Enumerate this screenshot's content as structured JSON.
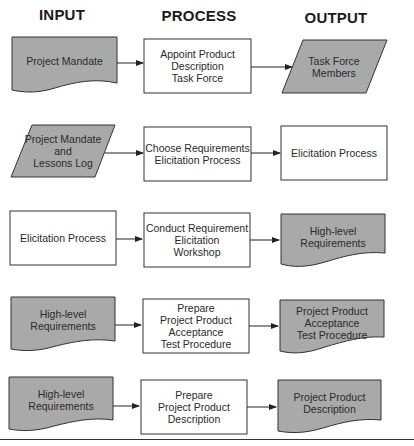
{
  "headers": {
    "input": "INPUT",
    "process": "PROCESS",
    "output": "OUTPUT"
  },
  "colors": {
    "shaded_fill": "#a9a9a9",
    "plain_fill": "#ffffff",
    "stroke": "#333333"
  },
  "rows": [
    {
      "input": {
        "shape": "document",
        "shaded": true,
        "label": "Project Mandate"
      },
      "process": {
        "shape": "rectangle",
        "label": "Appoint Product\nDescription\nTask Force"
      },
      "output": {
        "shape": "parallelogram",
        "shaded": true,
        "label": "Task Force\nMembers"
      }
    },
    {
      "input": {
        "shape": "parallelogram",
        "shaded": true,
        "label": "Project Mandate\nand\nLessons Log"
      },
      "process": {
        "shape": "rectangle",
        "label": "Choose Requirements\nElicitation Process"
      },
      "output": {
        "shape": "rectangle",
        "shaded": false,
        "label": "Elicitation Process"
      }
    },
    {
      "input": {
        "shape": "rectangle",
        "shaded": false,
        "label": "Elicitation Process"
      },
      "process": {
        "shape": "rectangle",
        "label": "Conduct Requirement\nElicitation\nWorkshop"
      },
      "output": {
        "shape": "document",
        "shaded": true,
        "label": "High-level\nRequirements"
      }
    },
    {
      "input": {
        "shape": "document",
        "shaded": true,
        "label": "High-level\nRequirements"
      },
      "process": {
        "shape": "rectangle",
        "label": "Prepare\nProject Product\nAcceptance\nTest Procedure"
      },
      "output": {
        "shape": "document",
        "shaded": true,
        "label": "Project Product\nAcceptance\nTest Procedure"
      }
    },
    {
      "input": {
        "shape": "document",
        "shaded": true,
        "label": "High-level\nRequirements"
      },
      "process": {
        "shape": "rectangle",
        "label": "Prepare\nProject Product\nDescription"
      },
      "output": {
        "shape": "document",
        "shaded": true,
        "label": "Project Product\nDescription"
      }
    }
  ]
}
